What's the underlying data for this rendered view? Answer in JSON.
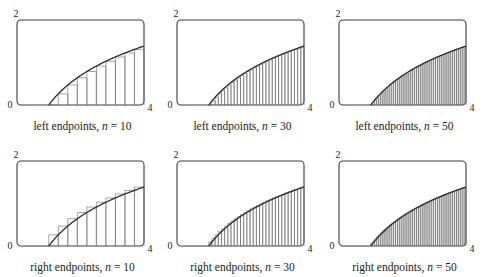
{
  "chart_data": {
    "type": "area",
    "title": "",
    "function": "ln(x)",
    "interval": [
      1,
      4
    ],
    "xlim": [
      0,
      4
    ],
    "ylim": [
      0,
      2
    ],
    "x_tick_labels": [
      "0",
      "4"
    ],
    "y_tick_labels": [
      "0",
      "2"
    ],
    "grid": false,
    "legend": null,
    "panels": [
      {
        "caption_prefix": "left endpoints, ",
        "caption_var": "n",
        "caption_eq": " = ",
        "n": 10,
        "rule": "left",
        "row": 0,
        "col": 0
      },
      {
        "caption_prefix": "left endpoints, ",
        "caption_var": "n",
        "caption_eq": " = ",
        "n": 30,
        "rule": "left",
        "row": 0,
        "col": 1
      },
      {
        "caption_prefix": "left endpoints, ",
        "caption_var": "n",
        "caption_eq": " = ",
        "n": 50,
        "rule": "left",
        "row": 0,
        "col": 2
      },
      {
        "caption_prefix": "right endpoints, ",
        "caption_var": "n",
        "caption_eq": " = ",
        "n": 10,
        "rule": "right",
        "row": 1,
        "col": 0
      },
      {
        "caption_prefix": "right endpoints, ",
        "caption_var": "n",
        "caption_eq": " = ",
        "n": 30,
        "rule": "right",
        "row": 1,
        "col": 1
      },
      {
        "caption_prefix": "right endpoints, ",
        "caption_var": "n",
        "caption_eq": " = ",
        "n": 50,
        "rule": "right",
        "row": 1,
        "col": 2
      }
    ],
    "curve_samples": {
      "x": [
        1.0,
        1.5,
        2.0,
        2.5,
        3.0,
        3.5,
        4.0
      ],
      "y": [
        0.0,
        0.405,
        0.693,
        0.916,
        1.099,
        1.253,
        1.386
      ]
    }
  },
  "labels": {
    "y_top": "2",
    "y_bottom": "0",
    "x_right": "4"
  },
  "style": {
    "frame_color": "#3a3a3a",
    "curve_color": "#2a2a2a",
    "rect_color": "#6a6a6a",
    "background": "#ffffff"
  }
}
